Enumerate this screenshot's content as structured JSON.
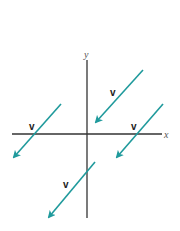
{
  "axes": {
    "x_label": "x",
    "y_label": "y",
    "color": "#333333"
  },
  "vectors": [
    {
      "label": "v",
      "from": [
        143,
        70
      ],
      "to": [
        95,
        123
      ],
      "label_pos": [
        113,
        93
      ]
    },
    {
      "label": "v",
      "from": [
        61,
        104
      ],
      "to": [
        13,
        158
      ],
      "label_pos": [
        32,
        126
      ]
    },
    {
      "label": "v",
      "from": [
        163,
        104
      ],
      "to": [
        116,
        158
      ],
      "label_pos": [
        134,
        126
      ]
    },
    {
      "label": "v",
      "from": [
        95,
        162
      ],
      "to": [
        48,
        218
      ],
      "label_pos": [
        66,
        184
      ]
    }
  ],
  "colors": {
    "vector": "#1f9a9c",
    "axis": "#333333"
  }
}
